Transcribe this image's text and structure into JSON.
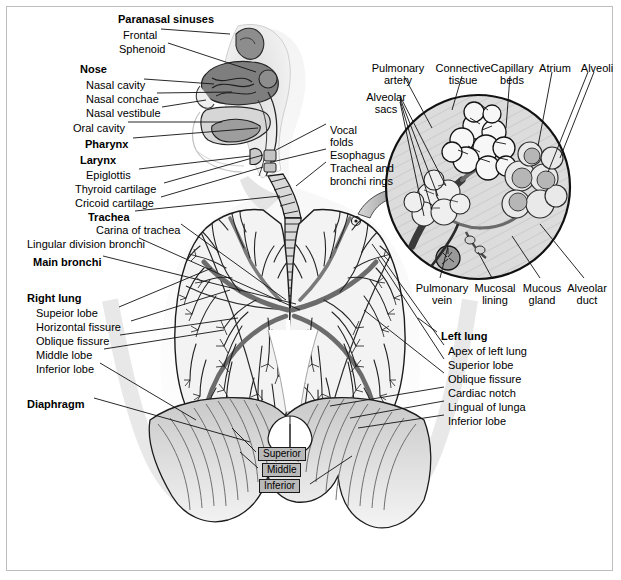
{
  "figure": {
    "border_color": "#bdbdbd",
    "ink_color": "#1a1a1a",
    "fill_light": "#e6e6e6",
    "fill_mid": "#bfbfbf",
    "fill_dark": "#8a8a8a"
  },
  "upper_airway_labels": [
    {
      "text": "Paranasal sinuses",
      "bold": true,
      "x": 118,
      "y": 13
    },
    {
      "text": "Frontal",
      "bold": false,
      "x": 123,
      "y": 29
    },
    {
      "text": "Sphenoid",
      "bold": false,
      "x": 119,
      "y": 43
    },
    {
      "text": "Nose",
      "bold": true,
      "x": 80,
      "y": 63
    },
    {
      "text": "Nasal cavity",
      "bold": false,
      "x": 86,
      "y": 79
    },
    {
      "text": "Nasal conchae",
      "bold": false,
      "x": 86,
      "y": 93
    },
    {
      "text": "Nasal vestibule",
      "bold": false,
      "x": 86,
      "y": 107
    },
    {
      "text": "Oral cavity",
      "bold": false,
      "x": 73,
      "y": 122
    },
    {
      "text": "Pharynx",
      "bold": true,
      "x": 85,
      "y": 138
    },
    {
      "text": "Larynx",
      "bold": true,
      "x": 80,
      "y": 154
    },
    {
      "text": "Epiglottis",
      "bold": false,
      "x": 86,
      "y": 169
    },
    {
      "text": "Thyroid cartilage",
      "bold": false,
      "x": 75,
      "y": 183
    },
    {
      "text": "Cricoid cartilage",
      "bold": false,
      "x": 75,
      "y": 197
    }
  ],
  "left_column_labels": [
    {
      "text": "Trachea",
      "bold": true,
      "x": 88,
      "y": 211
    },
    {
      "text": "Carina of trachea",
      "bold": false,
      "x": 96,
      "y": 224
    },
    {
      "text": "Lingular division bronchi",
      "bold": false,
      "x": 27,
      "y": 238
    },
    {
      "text": "Main bronchi",
      "bold": true,
      "x": 33,
      "y": 256
    },
    {
      "text": "Right lung",
      "bold": true,
      "x": 27,
      "y": 292
    },
    {
      "text": "Supeior lobe",
      "bold": false,
      "x": 36,
      "y": 307
    },
    {
      "text": "Horizontal fissure",
      "bold": false,
      "x": 36,
      "y": 321
    },
    {
      "text": "Oblique fissure",
      "bold": false,
      "x": 36,
      "y": 335
    },
    {
      "text": "Middle lobe",
      "bold": false,
      "x": 36,
      "y": 349
    },
    {
      "text": "Inferior lobe",
      "bold": false,
      "x": 36,
      "y": 363
    },
    {
      "text": "Diaphragm",
      "bold": true,
      "x": 27,
      "y": 398
    }
  ],
  "mid_column_labels": [
    {
      "text": "Vocal",
      "bold": false,
      "x": 330,
      "y": 124
    },
    {
      "text": "folds",
      "bold": false,
      "x": 330,
      "y": 136
    },
    {
      "text": "Esophagus",
      "bold": false,
      "x": 330,
      "y": 149
    },
    {
      "text": "Tracheal and",
      "bold": false,
      "x": 330,
      "y": 162
    },
    {
      "text": "bronchi rings",
      "bold": false,
      "x": 330,
      "y": 175
    }
  ],
  "inset_top_labels": [
    {
      "line1": "Pulmonary",
      "line2": "artery",
      "x": 367,
      "y": 62,
      "w": 62
    },
    {
      "line1": "Connective",
      "line2": "tissue",
      "x": 432,
      "y": 62,
      "w": 62
    },
    {
      "line1": "Capillary",
      "line2": "beds",
      "x": 483,
      "y": 62,
      "w": 58
    },
    {
      "line1": "Atrium",
      "line2": "",
      "x": 534,
      "y": 62,
      "w": 42
    },
    {
      "line1": "Alveoli",
      "line2": "",
      "x": 576,
      "y": 62,
      "w": 42
    }
  ],
  "inset_left_labels": [
    {
      "line1": "Alveolar",
      "line2": "sacs",
      "x": 360,
      "y": 91,
      "w": 52
    }
  ],
  "inset_bottom_labels": [
    {
      "line1": "Pulmonary",
      "line2": "vein",
      "x": 414,
      "y": 282,
      "w": 56
    },
    {
      "line1": "Mucosal",
      "line2": "lining",
      "x": 470,
      "y": 282,
      "w": 50
    },
    {
      "line1": "Mucous",
      "line2": "gland",
      "x": 518,
      "y": 282,
      "w": 48
    },
    {
      "line1": "Alveolar",
      "line2": "duct",
      "x": 562,
      "y": 282,
      "w": 50
    }
  ],
  "left_lung_labels": [
    {
      "text": "Left lung",
      "bold": true,
      "x": 441,
      "y": 330
    },
    {
      "text": "Apex of left lung",
      "bold": false,
      "x": 448,
      "y": 345
    },
    {
      "text": "Superior lobe",
      "bold": false,
      "x": 448,
      "y": 359
    },
    {
      "text": "Oblique fissure",
      "bold": false,
      "x": 448,
      "y": 373
    },
    {
      "text": "Cardiac notch",
      "bold": false,
      "x": 448,
      "y": 387
    },
    {
      "text": "Lingual of lunga",
      "bold": false,
      "x": 448,
      "y": 401
    },
    {
      "text": "Inferior lobe",
      "bold": false,
      "x": 448,
      "y": 415
    }
  ],
  "lobe_boxes": [
    {
      "text": "Superior",
      "x": 258,
      "y": 447
    },
    {
      "text": "Middle",
      "x": 262,
      "y": 463
    },
    {
      "text": "Inferior",
      "x": 259,
      "y": 479
    }
  ]
}
